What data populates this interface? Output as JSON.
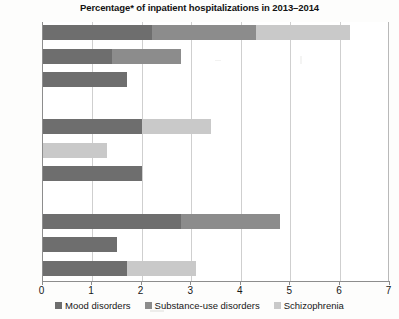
{
  "chart_data": {
    "type": "bar",
    "orientation": "horizontal",
    "stacked": true,
    "title": "Percentage* of inpatient hospitalizations in 2013–2014",
    "xlabel": "",
    "ylabel": "",
    "xlim": [
      0,
      7
    ],
    "xticks": [
      "0",
      "1",
      "2",
      "3",
      "4",
      "5",
      "6",
      "7"
    ],
    "grid": true,
    "legend_position": "bottom",
    "categories": [
      "B.C.",
      "Alta.",
      "Sask.",
      "Man.",
      "Ont.",
      "Que.",
      "N.B.",
      "N.S.",
      "P.E.I.",
      "N.L.",
      "Canada"
    ],
    "series": [
      {
        "name": "Mood disorders",
        "color": "#6e6e6e",
        "values": [
          2.2,
          1.4,
          1.7,
          0,
          2.0,
          0,
          2.0,
          0,
          2.8,
          1.5,
          1.7
        ]
      },
      {
        "name": "Substance-use disorders",
        "color": "#8c8c8c",
        "values": [
          2.1,
          1.4,
          0,
          0,
          0,
          0,
          0,
          0,
          2.0,
          0,
          0
        ]
      },
      {
        "name": "Schizophrenia",
        "color": "#c9c9c9",
        "values": [
          1.9,
          0,
          0,
          0,
          1.4,
          1.3,
          0,
          0,
          0,
          0,
          1.4
        ]
      }
    ],
    "totals": [
      6.2,
      2.8,
      1.7,
      0,
      3.4,
      1.3,
      2.0,
      0,
      4.8,
      1.5,
      3.1
    ]
  },
  "legend": {
    "items": [
      {
        "label": "Mood disorders",
        "color": "#6e6e6e"
      },
      {
        "label": "Substance-use disorders",
        "color": "#8c8c8c"
      },
      {
        "label": "Schizophrenia",
        "color": "#c9c9c9"
      }
    ]
  }
}
